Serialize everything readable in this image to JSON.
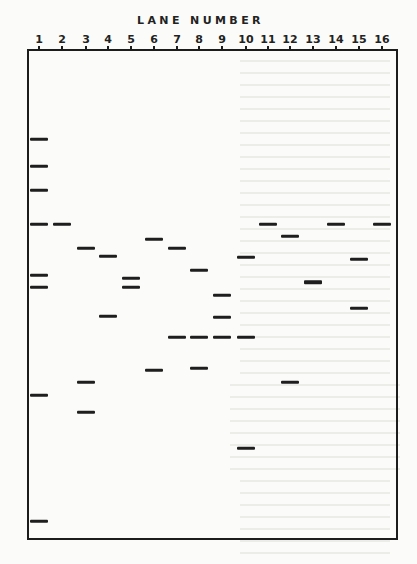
{
  "figure": {
    "title": "LANE NUMBER",
    "lanes": [
      {
        "label": "1",
        "x": 39
      },
      {
        "label": "2",
        "x": 62
      },
      {
        "label": "3",
        "x": 86
      },
      {
        "label": "4",
        "x": 108
      },
      {
        "label": "5",
        "x": 131
      },
      {
        "label": "6",
        "x": 154
      },
      {
        "label": "7",
        "x": 177
      },
      {
        "label": "8",
        "x": 199
      },
      {
        "label": "9",
        "x": 222
      },
      {
        "label": "10",
        "x": 246
      },
      {
        "label": "11",
        "x": 268
      },
      {
        "label": "12",
        "x": 290
      },
      {
        "label": "13",
        "x": 313
      },
      {
        "label": "14",
        "x": 336
      },
      {
        "label": "15",
        "x": 359
      },
      {
        "label": "16",
        "x": 382
      }
    ],
    "bands": [
      {
        "lane": 1,
        "y": 139
      },
      {
        "lane": 1,
        "y": 166
      },
      {
        "lane": 1,
        "y": 190
      },
      {
        "lane": 1,
        "y": 224
      },
      {
        "lane": 1,
        "y": 275
      },
      {
        "lane": 1,
        "y": 287
      },
      {
        "lane": 1,
        "y": 395
      },
      {
        "lane": 1,
        "y": 521
      },
      {
        "lane": 2,
        "y": 224
      },
      {
        "lane": 3,
        "y": 248
      },
      {
        "lane": 3,
        "y": 382
      },
      {
        "lane": 3,
        "y": 412
      },
      {
        "lane": 4,
        "y": 256
      },
      {
        "lane": 4,
        "y": 316
      },
      {
        "lane": 5,
        "y": 278
      },
      {
        "lane": 5,
        "y": 287
      },
      {
        "lane": 6,
        "y": 239
      },
      {
        "lane": 6,
        "y": 370
      },
      {
        "lane": 7,
        "y": 248
      },
      {
        "lane": 7,
        "y": 337
      },
      {
        "lane": 8,
        "y": 270
      },
      {
        "lane": 8,
        "y": 337
      },
      {
        "lane": 8,
        "y": 368
      },
      {
        "lane": 9,
        "y": 295
      },
      {
        "lane": 9,
        "y": 317
      },
      {
        "lane": 9,
        "y": 337
      },
      {
        "lane": 10,
        "y": 257
      },
      {
        "lane": 10,
        "y": 337
      },
      {
        "lane": 10,
        "y": 448
      },
      {
        "lane": 11,
        "y": 224
      },
      {
        "lane": 12,
        "y": 236
      },
      {
        "lane": 12,
        "y": 382
      },
      {
        "lane": 13,
        "y": 282,
        "thick": true
      },
      {
        "lane": 14,
        "y": 224
      },
      {
        "lane": 15,
        "y": 259
      },
      {
        "lane": 15,
        "y": 308
      },
      {
        "lane": 16,
        "y": 224
      }
    ]
  }
}
